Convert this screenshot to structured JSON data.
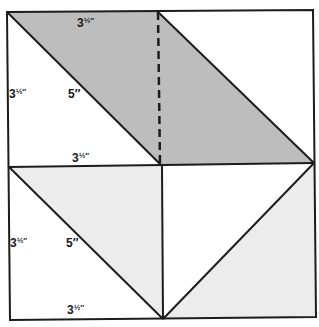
{
  "diagram": {
    "colors": {
      "line": "#1c1c1c",
      "dark_shade": "#bdbdbd",
      "light_shade": "#ececec",
      "background": "#ffffff"
    },
    "labels": {
      "top_edge": "3",
      "top_edge_frac": "½″",
      "upper_left_side": "3",
      "upper_left_side_frac": "½″",
      "upper_diagonal": "5″",
      "middle_edge": "3",
      "middle_edge_frac": "½″",
      "lower_left_side": "3",
      "lower_left_side_frac": "½″",
      "lower_diagonal": "5″",
      "bottom_edge": "3",
      "bottom_edge_frac": "½″"
    }
  }
}
